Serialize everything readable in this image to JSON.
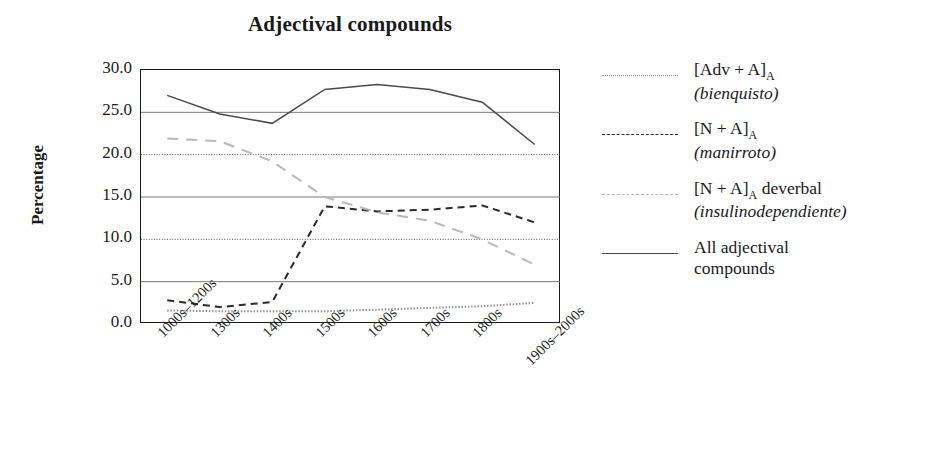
{
  "chart_data": {
    "type": "line",
    "title": "Adjectival compounds",
    "xlabel": "",
    "ylabel": "Percentage",
    "categories": [
      "1000s–1200s",
      "1300s",
      "1400s",
      "1500s",
      "1600s",
      "1700s",
      "1800s",
      "1900s–2000s"
    ],
    "ylim": [
      0,
      30
    ],
    "yticks": [
      "0.0",
      "5.0",
      "10.0",
      "15.0",
      "20.0",
      "25.0",
      "30.0"
    ],
    "ytick_values": [
      0,
      5,
      10,
      15,
      20,
      25,
      30
    ],
    "grid": "horizontal",
    "legend_position": "right",
    "series": [
      {
        "name": "[Adv + A]A",
        "name_main": "[Adv + A]",
        "name_sub": "A",
        "example": "(bienquisto)",
        "style": "dotted",
        "color": "#8a8a8a",
        "values": [
          1.6,
          1.5,
          1.5,
          1.5,
          1.7,
          1.9,
          2.1,
          2.5
        ]
      },
      {
        "name": "[N + A]A",
        "name_main": "[N + A]",
        "name_sub": "A",
        "example": "(manirroto)",
        "style": "dashed",
        "color": "#2a2a2a",
        "values": [
          2.8,
          2.0,
          2.6,
          13.9,
          13.3,
          13.5,
          14.0,
          12.0
        ]
      },
      {
        "name": "[N + A]A deverbal",
        "name_main": "[N + A]",
        "name_sub": "A",
        "name_tail": " deverbal",
        "example": "(insulinodependiente)",
        "style": "long-dash",
        "color": "#b9b9b9",
        "values": [
          21.9,
          21.6,
          19.2,
          15.0,
          13.2,
          12.2,
          10.0,
          7.0
        ]
      },
      {
        "name": "All adjectival compounds",
        "name_main": "All adjectival",
        "name_tail": "compounds",
        "example": "",
        "style": "solid",
        "color": "#4a4a4a",
        "values": [
          27.0,
          24.8,
          23.7,
          27.7,
          28.3,
          27.7,
          26.2,
          21.2
        ]
      }
    ]
  }
}
